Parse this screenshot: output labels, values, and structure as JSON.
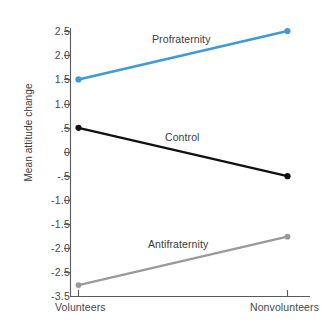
{
  "chart_data": {
    "type": "line",
    "title": "",
    "xlabel": "",
    "ylabel": "Mean attitude change",
    "categories": [
      "Volunteers",
      "Nonvolunteers"
    ],
    "ylim": [
      -3.5,
      2.5
    ],
    "grid": false,
    "legend_position": "inline-annotations",
    "ytick_labels": [
      "2.5",
      "2.0",
      "1.5",
      "1.0",
      ".5",
      "0",
      "-.5",
      "-1.0",
      "-1.5",
      "-2.0",
      "-2.5",
      "-3.5"
    ],
    "ytick_values": [
      2.5,
      2.0,
      1.5,
      1.0,
      0.5,
      0,
      -0.5,
      -1.0,
      -1.5,
      -2.0,
      -2.5,
      -3.5
    ],
    "series": [
      {
        "name": "Profraternity",
        "color": "#3f9ad6",
        "values": [
          1.5,
          2.5
        ],
        "label_text": "Profraternity"
      },
      {
        "name": "Control",
        "color": "#111111",
        "values": [
          0.5,
          -0.5
        ],
        "label_text": "Control"
      },
      {
        "name": "Antifraternity",
        "color": "#9a9a9a",
        "values": [
          -2.75,
          -1.75
        ],
        "label_text": "Antifraternity"
      }
    ]
  },
  "axis": {
    "y_title": "Mean attitude change",
    "x_categories": [
      "Volunteers",
      "Nonvolunteers"
    ]
  }
}
